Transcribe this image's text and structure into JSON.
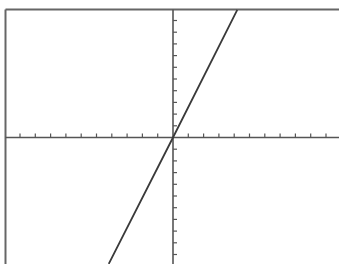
{
  "chart_data": {
    "type": "line",
    "title": "",
    "xlabel": "",
    "ylabel": "",
    "xlim": [
      -10.9,
      10.8
    ],
    "ylim": [
      -10.8,
      10.9
    ],
    "grid": false,
    "legend": null,
    "x_ticks_spacing": 1,
    "y_ticks_spacing": 1,
    "x_ticks_count_each_side": 10,
    "y_ticks_count_each_side": 10,
    "series": [
      {
        "name": "line through origin",
        "equation_estimate": "y = 2.6x",
        "x": [
          -4.2,
          0,
          4.2
        ],
        "y": [
          -10.8,
          0,
          10.9
        ]
      }
    ]
  },
  "layout": {
    "frame": {
      "left": 5.5,
      "top": 9.5,
      "right": 339,
      "bottom": 264
    },
    "origin_px": {
      "x": 173,
      "y": 137.5
    },
    "x_unit_px": 15.3,
    "y_unit_px": 11.7,
    "colors": {
      "axis": "#555555",
      "line": "#3a3a3a",
      "frame": "#666666",
      "background": "#ffffff"
    }
  }
}
